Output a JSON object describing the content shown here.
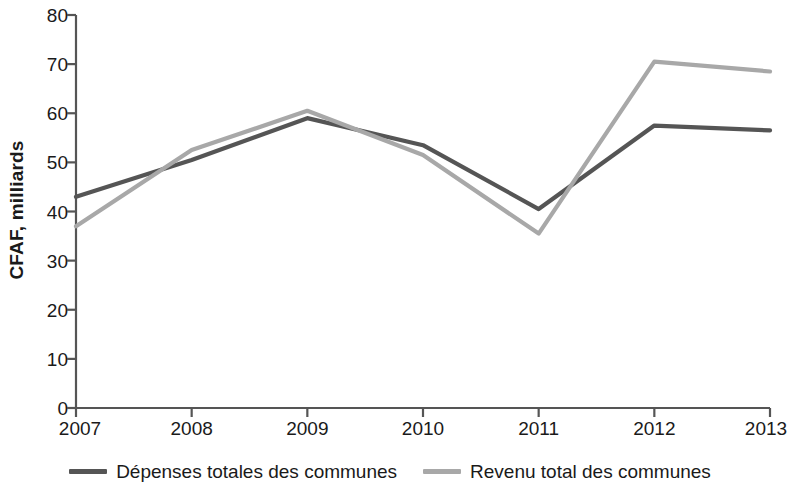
{
  "chart_data": {
    "type": "line",
    "title": "",
    "xlabel": "",
    "ylabel": "CFAF, milliards",
    "x": [
      2007,
      2008,
      2009,
      2010,
      2011,
      2012,
      2013
    ],
    "categories": [
      "2007",
      "2008",
      "2009",
      "2010",
      "2011",
      "2012",
      "2013"
    ],
    "xlim": [
      2007,
      2013
    ],
    "ylim": [
      0,
      80
    ],
    "yticks": [
      0,
      10,
      20,
      30,
      40,
      50,
      60,
      70,
      80
    ],
    "ytick_labels": [
      "0",
      "10",
      "20",
      "30",
      "40",
      "50",
      "60",
      "70",
      "80"
    ],
    "grid": false,
    "legend_position": "bottom",
    "series": [
      {
        "name": "Dépenses totales des communes",
        "color": "#555555",
        "values": [
          43,
          50.5,
          59,
          53.5,
          40.5,
          57.5,
          56.5
        ]
      },
      {
        "name": "Revenu total des communes",
        "color": "#a8a8a8",
        "values": [
          37,
          52.5,
          60.5,
          51.5,
          35.5,
          70.5,
          68.5
        ]
      }
    ]
  },
  "axis": {
    "y_title": "CFAF, milliards",
    "axis_color": "#555555"
  }
}
